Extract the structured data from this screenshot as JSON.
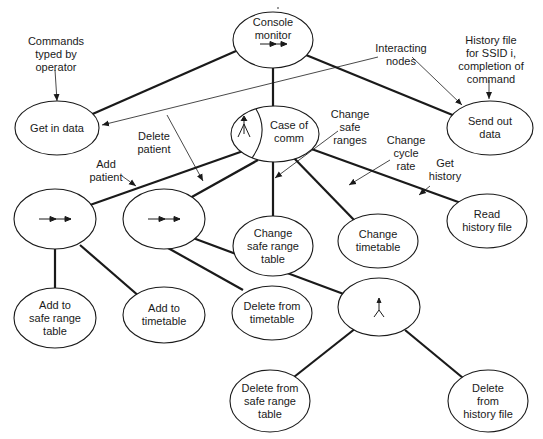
{
  "diagram": {
    "nodes": [
      {
        "id": "console_monitor",
        "label": "Console\nmonitor",
        "icon": "sequence-arrow"
      },
      {
        "id": "get_in_data",
        "label": "Get in data"
      },
      {
        "id": "send_out_data",
        "label": "Send out data"
      },
      {
        "id": "case_of_comm",
        "label": "Case of\ncomm",
        "icon": "selection-fork"
      },
      {
        "id": "add_patient_seq",
        "label": "",
        "icon": "sequence-arrow"
      },
      {
        "id": "delete_patient_seq",
        "label": "",
        "icon": "sequence-arrow"
      },
      {
        "id": "change_safe_range_table",
        "label": "Change\nsafe range\ntable"
      },
      {
        "id": "change_timetable",
        "label": "Change\ntimetable"
      },
      {
        "id": "read_history_file",
        "label": "Read\nhistory file"
      },
      {
        "id": "add_to_safe_range_table",
        "label": "Add to\nsafe range\ntable"
      },
      {
        "id": "add_to_timetable",
        "label": "Add to\ntimetable"
      },
      {
        "id": "delete_from_timetable",
        "label": "Delete from\ntimetable"
      },
      {
        "id": "parallel_node",
        "label": "",
        "icon": "parallel-fork"
      },
      {
        "id": "delete_from_safe_range_table",
        "label": "Delete from\nsafe range\ntable"
      },
      {
        "id": "delete_from_history_file",
        "label": "Delete\nfrom\nhistory file"
      }
    ],
    "edges": [
      [
        "console_monitor",
        "get_in_data"
      ],
      [
        "console_monitor",
        "case_of_comm"
      ],
      [
        "console_monitor",
        "send_out_data"
      ],
      [
        "case_of_comm",
        "add_patient_seq"
      ],
      [
        "case_of_comm",
        "delete_patient_seq"
      ],
      [
        "case_of_comm",
        "change_safe_range_table"
      ],
      [
        "case_of_comm",
        "change_timetable"
      ],
      [
        "case_of_comm",
        "read_history_file"
      ],
      [
        "add_patient_seq",
        "add_to_safe_range_table"
      ],
      [
        "add_patient_seq",
        "add_to_timetable"
      ],
      [
        "delete_patient_seq",
        "delete_from_timetable"
      ],
      [
        "delete_patient_seq",
        "parallel_node"
      ],
      [
        "parallel_node",
        "delete_from_safe_range_table"
      ],
      [
        "parallel_node",
        "delete_from_history_file"
      ]
    ],
    "annotations": [
      {
        "id": "commands_typed",
        "text": "Commands\ntyped by\noperator"
      },
      {
        "id": "interacting_nodes",
        "text": "Interacting\nnodes"
      },
      {
        "id": "history_file_for_ssid",
        "text": "History file\nfor SSID i,\ncompletion of\ncommand"
      },
      {
        "id": "add_patient",
        "text": "Add\npatient"
      },
      {
        "id": "delete_patient",
        "text": "Delete\npatient"
      },
      {
        "id": "change_safe_ranges",
        "text": "Change\nsafe\nranges"
      },
      {
        "id": "change_cycle_rate",
        "text": "Change\ncycle\nrate"
      },
      {
        "id": "get_history",
        "text": "Get\nhistory"
      }
    ],
    "colors": {
      "line": "#1a1a1a",
      "background": "#ffffff"
    }
  }
}
